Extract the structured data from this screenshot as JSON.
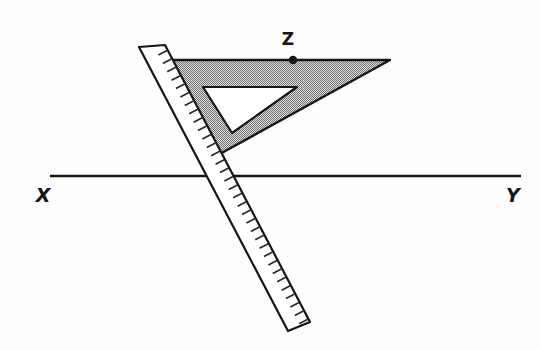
{
  "figure": {
    "background_color": "#fdfdfd",
    "ink_color": "#151515",
    "width": 540,
    "height": 350
  },
  "line_xy": {
    "name": "line-xy",
    "x1": 50,
    "y1": 176,
    "x2": 521,
    "y2": 176,
    "stroke_width": 2.6,
    "color": "#151515"
  },
  "labels": {
    "x": {
      "text": "X",
      "x": 43,
      "y": 202
    },
    "y": {
      "text": "Y",
      "x": 513,
      "y": 202
    },
    "z": {
      "text": "Z",
      "x": 288,
      "y": 45
    }
  },
  "point_z": {
    "name": "point-z",
    "cx": 293,
    "cy": 60,
    "r": 4.2,
    "color": "#151515"
  },
  "set_square": {
    "name": "set-square",
    "fill_color": "#b8b8b8",
    "stipple_color": "#4a4a4a",
    "outline_color": "#151515",
    "outline_width": 2.4,
    "outer_points": "156,60 390,60 218,155",
    "cutout_points": "203,87 297,87 232,133",
    "cutout_fill": "#ffffff"
  },
  "ruler": {
    "name": "ruler",
    "fill_color": "#ffffff",
    "outline_color": "#151515",
    "outline_width": 2.2,
    "body_points": "139,47 165,45 310,322 288,331",
    "tick_color": "#2a2a2a",
    "tick_count": 33,
    "angle_degrees": 62
  }
}
